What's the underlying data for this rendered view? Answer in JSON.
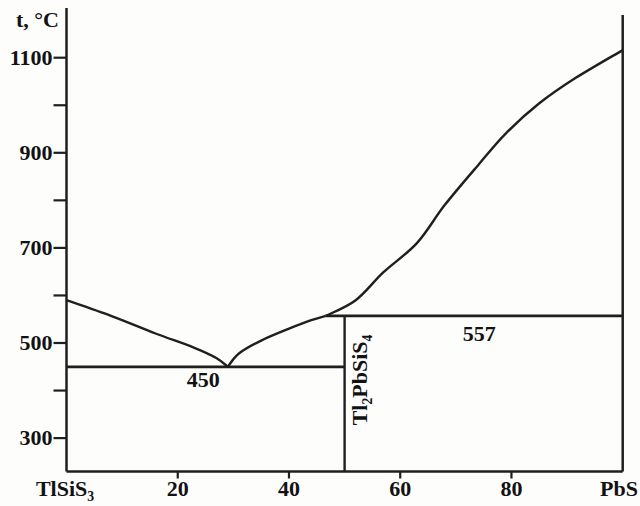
{
  "figure": {
    "bg": "#fdfdfc",
    "line_color": "#1f1f1f",
    "text_color": "#121212"
  },
  "chart_data": {
    "type": "line",
    "kind": "binary-phase-diagram",
    "title": "",
    "y_axis": {
      "label": "t, °C",
      "labeled_ticks": [
        1100,
        900,
        700,
        500,
        300
      ],
      "unlabeled_ticks": [
        1000,
        800,
        600,
        400
      ],
      "range_drawn": [
        231,
        1204
      ]
    },
    "x_axis": {
      "left_end_label": [
        {
          "t": "TlSiS"
        },
        {
          "sub": "3"
        }
      ],
      "right_end_label": [
        {
          "t": "PbS"
        }
      ],
      "labeled_ticks": [
        20,
        40,
        60,
        80
      ],
      "range": [
        0,
        100
      ]
    },
    "series": [
      {
        "name": "liquidus-left-descending",
        "points": [
          [
            0,
            590
          ],
          [
            8,
            557
          ],
          [
            16,
            520
          ],
          [
            23,
            490
          ],
          [
            27,
            468
          ],
          [
            29,
            450
          ]
        ]
      },
      {
        "name": "liquidus-left-ascending",
        "points": [
          [
            29,
            450
          ],
          [
            31,
            478
          ],
          [
            35,
            505
          ],
          [
            40,
            530
          ],
          [
            44,
            548
          ],
          [
            46.6,
            557
          ]
        ]
      },
      {
        "name": "liquidus-right",
        "points": [
          [
            46.6,
            557
          ],
          [
            52,
            590
          ],
          [
            57,
            649
          ],
          [
            63,
            710
          ],
          [
            68,
            790
          ],
          [
            74,
            874
          ],
          [
            79,
            941
          ],
          [
            85,
            1004
          ],
          [
            91.5,
            1057
          ],
          [
            100,
            1116
          ]
        ]
      }
    ],
    "isotherms": [
      {
        "name": "isotherm-450",
        "t": 450,
        "x_from": 0,
        "x_to": 50,
        "label": "450"
      },
      {
        "name": "isotherm-557",
        "t": 557,
        "x_from": 46.6,
        "x_to": 100,
        "label": "557"
      }
    ],
    "vertical_lines": [
      {
        "name": "compound-composition-line",
        "x": 50,
        "t_from": 231,
        "t_to": 557
      }
    ],
    "annotations": [
      {
        "name": "isotherm-450-label",
        "segs": [
          {
            "t": "450"
          }
        ],
        "x": 24.6,
        "t": 422,
        "rotate": 0
      },
      {
        "name": "isotherm-557-label",
        "segs": [
          {
            "t": "557"
          }
        ],
        "x": 74.2,
        "t": 519,
        "rotate": 0
      },
      {
        "name": "compound-formula-label",
        "segs": [
          {
            "t": "Tl"
          },
          {
            "sub": "2"
          },
          {
            "t": "PbSiS"
          },
          {
            "sub": "4"
          }
        ],
        "x": 52.8,
        "t": 423,
        "rotate": -90
      }
    ]
  }
}
